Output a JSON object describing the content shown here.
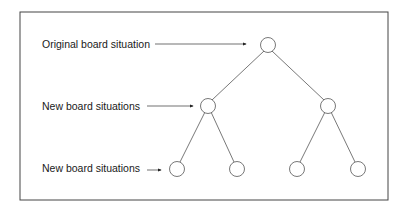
{
  "diagram": {
    "type": "game-tree",
    "colors": {
      "line": "#555555",
      "text": "#1a1a1a",
      "frame": "#444444",
      "background": "#ffffff"
    },
    "labels": [
      {
        "text": "Original board situation",
        "level": 0
      },
      {
        "text": "New board situations",
        "level": 1
      },
      {
        "text": "New board situations",
        "level": 2
      }
    ],
    "nodes": [
      {
        "id": "root",
        "level": 0,
        "x": 268,
        "y": 45
      },
      {
        "id": "l1a",
        "level": 1,
        "x": 208,
        "y": 106
      },
      {
        "id": "l1b",
        "level": 1,
        "x": 328,
        "y": 106
      },
      {
        "id": "l2a",
        "level": 2,
        "x": 177,
        "y": 169
      },
      {
        "id": "l2b",
        "level": 2,
        "x": 237,
        "y": 169
      },
      {
        "id": "l2c",
        "level": 2,
        "x": 297,
        "y": 169
      },
      {
        "id": "l2d",
        "level": 2,
        "x": 358,
        "y": 169
      }
    ],
    "edges": [
      [
        "root",
        "l1a"
      ],
      [
        "root",
        "l1b"
      ],
      [
        "l1a",
        "l2a"
      ],
      [
        "l1a",
        "l2b"
      ],
      [
        "l1b",
        "l2c"
      ],
      [
        "l1b",
        "l2d"
      ]
    ]
  }
}
